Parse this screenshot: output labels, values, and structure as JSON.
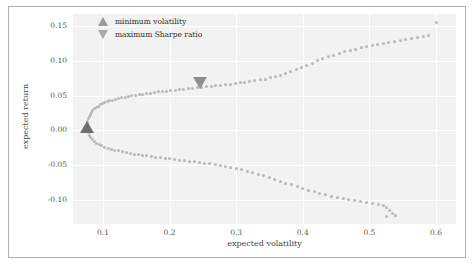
{
  "chart_data": {
    "type": "scatter",
    "title": "",
    "xlabel": "expected volatility",
    "ylabel": "expected return",
    "xlim": [
      0.055,
      0.63
    ],
    "ylim": [
      -0.135,
      0.168
    ],
    "xticks": [
      "0.1",
      "0.2",
      "0.3",
      "0.4",
      "0.5",
      "0.6"
    ],
    "xtick_values": [
      0.1,
      0.2,
      0.3,
      0.4,
      0.5,
      0.6
    ],
    "yticks": [
      "0.15",
      "0.10",
      "0.05",
      "0.00",
      "-0.05",
      "-0.10"
    ],
    "ytick_values": [
      0.15,
      0.1,
      0.05,
      0.0,
      -0.05,
      -0.1
    ],
    "grid": true,
    "grid_color": "#ffffff",
    "panel_color": "#f2f2f2",
    "marker_color": "#b8b8b8",
    "legend_position": "upper left",
    "legend": [
      {
        "label": "minimum volatility",
        "marker": "triangle-up",
        "color": "#9a9a9a"
      },
      {
        "label": "maximum Sharpe ratio",
        "marker": "triangle-down",
        "color": "#a8a8a8"
      }
    ],
    "annotations": [
      {
        "name": "minimum-volatility-marker",
        "marker": "triangle-up",
        "x": 0.076,
        "y": 0.005
      },
      {
        "name": "maximum-sharpe-marker",
        "marker": "triangle-down",
        "x": 0.246,
        "y": 0.068
      }
    ],
    "series": [
      {
        "name": "efficient-frontier-upper",
        "points": [
          [
            0.0765,
            0.0095
          ],
          [
            0.0772,
            0.0135
          ],
          [
            0.0781,
            0.0172
          ],
          [
            0.0793,
            0.0205
          ],
          [
            0.0808,
            0.0235
          ],
          [
            0.0826,
            0.0263
          ],
          [
            0.0847,
            0.0289
          ],
          [
            0.0871,
            0.0312
          ],
          [
            0.0897,
            0.0333
          ],
          [
            0.0926,
            0.0352
          ],
          [
            0.0957,
            0.0369
          ],
          [
            0.0991,
            0.0385
          ],
          [
            0.1027,
            0.04
          ],
          [
            0.1065,
            0.0414
          ],
          [
            0.1105,
            0.0427
          ],
          [
            0.1147,
            0.0439
          ],
          [
            0.1191,
            0.045
          ],
          [
            0.1236,
            0.0461
          ],
          [
            0.1283,
            0.0471
          ],
          [
            0.1332,
            0.0481
          ],
          [
            0.1382,
            0.049
          ],
          [
            0.1434,
            0.0499
          ],
          [
            0.1487,
            0.0508
          ],
          [
            0.1541,
            0.0516
          ],
          [
            0.1597,
            0.0524
          ],
          [
            0.1654,
            0.0532
          ],
          [
            0.1712,
            0.054
          ],
          [
            0.1771,
            0.0547
          ],
          [
            0.1831,
            0.0555
          ],
          [
            0.1893,
            0.0562
          ],
          [
            0.1955,
            0.0569
          ],
          [
            0.2018,
            0.0576
          ],
          [
            0.2082,
            0.0583
          ],
          [
            0.2147,
            0.059
          ],
          [
            0.2213,
            0.0597
          ],
          [
            0.228,
            0.0604
          ],
          [
            0.2347,
            0.0611
          ],
          [
            0.2415,
            0.0618
          ],
          [
            0.246,
            0.068
          ],
          [
            0.2484,
            0.0625
          ],
          [
            0.2554,
            0.0632
          ],
          [
            0.2624,
            0.0639
          ],
          [
            0.2695,
            0.0646
          ],
          [
            0.2766,
            0.0653
          ],
          [
            0.2838,
            0.0661
          ],
          [
            0.2911,
            0.0669
          ],
          [
            0.2984,
            0.0677
          ],
          [
            0.3058,
            0.0686
          ],
          [
            0.3132,
            0.0695
          ],
          [
            0.3207,
            0.0705
          ],
          [
            0.3282,
            0.0716
          ],
          [
            0.3358,
            0.0728
          ],
          [
            0.3434,
            0.0742
          ],
          [
            0.3511,
            0.0758
          ],
          [
            0.3588,
            0.0777
          ],
          [
            0.3666,
            0.0798
          ],
          [
            0.3744,
            0.0822
          ],
          [
            0.3822,
            0.0849
          ],
          [
            0.3901,
            0.0878
          ],
          [
            0.398,
            0.0909
          ],
          [
            0.406,
            0.0941
          ],
          [
            0.414,
            0.0973
          ],
          [
            0.422,
            0.1004
          ],
          [
            0.4301,
            0.1034
          ],
          [
            0.4382,
            0.1062
          ],
          [
            0.4463,
            0.1088
          ],
          [
            0.4545,
            0.1112
          ],
          [
            0.4627,
            0.1134
          ],
          [
            0.4709,
            0.1154
          ],
          [
            0.4792,
            0.1173
          ],
          [
            0.4875,
            0.119
          ],
          [
            0.4958,
            0.1206
          ],
          [
            0.5041,
            0.1221
          ],
          [
            0.5125,
            0.1236
          ],
          [
            0.5209,
            0.125
          ],
          [
            0.5293,
            0.1264
          ],
          [
            0.5378,
            0.1277
          ],
          [
            0.5463,
            0.1291
          ],
          [
            0.5548,
            0.1305
          ],
          [
            0.5634,
            0.132
          ],
          [
            0.572,
            0.1336
          ],
          [
            0.5806,
            0.1354
          ],
          [
            0.5893,
            0.1374
          ],
          [
            0.601,
            0.1552
          ]
        ]
      },
      {
        "name": "efficient-frontier-lower",
        "points": [
          [
            0.0768,
            0.0005
          ],
          [
            0.0779,
            -0.0036
          ],
          [
            0.0795,
            -0.0072
          ],
          [
            0.0816,
            -0.0104
          ],
          [
            0.0842,
            -0.0133
          ],
          [
            0.0872,
            -0.0159
          ],
          [
            0.0906,
            -0.0182
          ],
          [
            0.0944,
            -0.0203
          ],
          [
            0.0985,
            -0.0222
          ],
          [
            0.1029,
            -0.0239
          ],
          [
            0.1076,
            -0.0255
          ],
          [
            0.1126,
            -0.027
          ],
          [
            0.1178,
            -0.0283
          ],
          [
            0.1232,
            -0.0296
          ],
          [
            0.1288,
            -0.0308
          ],
          [
            0.1346,
            -0.0319
          ],
          [
            0.1406,
            -0.033
          ],
          [
            0.1467,
            -0.034
          ],
          [
            0.153,
            -0.035
          ],
          [
            0.1594,
            -0.0359
          ],
          [
            0.166,
            -0.0368
          ],
          [
            0.1727,
            -0.0377
          ],
          [
            0.1795,
            -0.0386
          ],
          [
            0.1864,
            -0.0394
          ],
          [
            0.1934,
            -0.0403
          ],
          [
            0.2005,
            -0.0411
          ],
          [
            0.2077,
            -0.0419
          ],
          [
            0.215,
            -0.0428
          ],
          [
            0.2224,
            -0.0436
          ],
          [
            0.2299,
            -0.0445
          ],
          [
            0.2374,
            -0.0454
          ],
          [
            0.245,
            -0.0463
          ],
          [
            0.2527,
            -0.0473
          ],
          [
            0.2605,
            -0.0484
          ],
          [
            0.2683,
            -0.0495
          ],
          [
            0.2762,
            -0.0507
          ],
          [
            0.2841,
            -0.052
          ],
          [
            0.2921,
            -0.0535
          ],
          [
            0.3002,
            -0.0551
          ],
          [
            0.3083,
            -0.0568
          ],
          [
            0.3164,
            -0.0587
          ],
          [
            0.3246,
            -0.0608
          ],
          [
            0.3329,
            -0.063
          ],
          [
            0.3412,
            -0.0654
          ],
          [
            0.3495,
            -0.0679
          ],
          [
            0.3578,
            -0.0705
          ],
          [
            0.3662,
            -0.0732
          ],
          [
            0.3746,
            -0.0759
          ],
          [
            0.3831,
            -0.0786
          ],
          [
            0.3916,
            -0.0813
          ],
          [
            0.4001,
            -0.0839
          ],
          [
            0.4086,
            -0.0864
          ],
          [
            0.4172,
            -0.0888
          ],
          [
            0.4258,
            -0.091
          ],
          [
            0.4344,
            -0.0931
          ],
          [
            0.443,
            -0.0951
          ],
          [
            0.4517,
            -0.0969
          ],
          [
            0.4604,
            -0.0986
          ],
          [
            0.4691,
            -0.1002
          ],
          [
            0.4778,
            -0.1017
          ],
          [
            0.4866,
            -0.1032
          ],
          [
            0.4953,
            -0.1046
          ],
          [
            0.5041,
            -0.106
          ],
          [
            0.5129,
            -0.1074
          ],
          [
            0.5217,
            -0.1089
          ],
          [
            0.526,
            -0.1118
          ],
          [
            0.5305,
            -0.1155
          ],
          [
            0.535,
            -0.1192
          ],
          [
            0.5396,
            -0.1232
          ],
          [
            0.525,
            -0.1248
          ]
        ]
      }
    ]
  }
}
